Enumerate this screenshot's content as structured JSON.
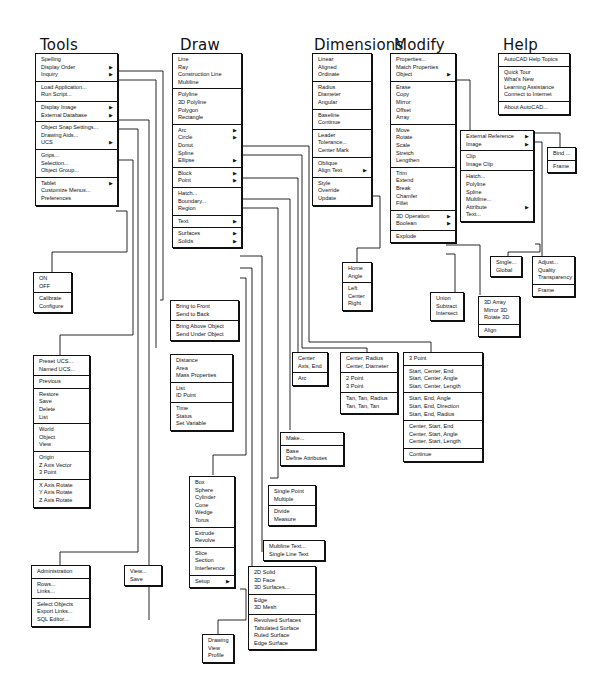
{
  "headers": {
    "tools": "Tools",
    "draw": "Draw",
    "dimensions": "Dimensions",
    "modify": "Modify",
    "help": "Help"
  },
  "menus": {
    "tools": [
      [
        {
          "label": "Spelling"
        },
        {
          "label": "Display Order",
          "sub": true
        },
        {
          "label": "Inquiry",
          "sub": true
        }
      ],
      [
        {
          "label": "Load Application..."
        },
        {
          "label": "Run Script..."
        }
      ],
      [
        {
          "label": "Display Image",
          "sub": true
        },
        {
          "label": "External Database",
          "sub": true
        }
      ],
      [
        {
          "label": "Object Snap Settings..."
        },
        {
          "label": "Drawing Aids..."
        },
        {
          "label": "UCS",
          "sub": true
        }
      ],
      [
        {
          "label": "Grips..."
        },
        {
          "label": "Selection..."
        },
        {
          "label": "Object Group..."
        }
      ],
      [
        {
          "label": "Tablet",
          "sub": true
        },
        {
          "label": "Customize Menus..."
        },
        {
          "label": "Preferences"
        }
      ]
    ],
    "tablet": [
      [
        {
          "label": "ON"
        },
        {
          "label": "OFF"
        }
      ],
      [
        {
          "label": "Calibrate"
        },
        {
          "label": "Configure"
        }
      ]
    ],
    "ucs": [
      [
        {
          "label": "Preset UCS..."
        },
        {
          "label": "Named UCS..."
        }
      ],
      [
        {
          "label": "Previous"
        }
      ],
      [
        {
          "label": "Restore"
        },
        {
          "label": "Save"
        },
        {
          "label": "Delete"
        },
        {
          "label": "List"
        }
      ],
      [
        {
          "label": "World"
        },
        {
          "label": "Object"
        },
        {
          "label": "View"
        }
      ],
      [
        {
          "label": "Origin"
        },
        {
          "label": "Z Axis Vector"
        },
        {
          "label": "3 Point"
        }
      ],
      [
        {
          "label": "X Axis Rotate"
        },
        {
          "label": "Y Axis Rotate"
        },
        {
          "label": "Z Axis Rotate"
        }
      ]
    ],
    "external_database": [
      [
        {
          "label": "Administration"
        }
      ],
      [
        {
          "label": "Rows..."
        },
        {
          "label": "Links..."
        }
      ],
      [
        {
          "label": "Select Objects"
        },
        {
          "label": "Export Links..."
        },
        {
          "label": "SQL Editor..."
        }
      ]
    ],
    "display_image": [
      [
        {
          "label": "View..."
        },
        {
          "label": "Save"
        }
      ]
    ],
    "display_order": [
      [
        {
          "label": "Bring to Front"
        },
        {
          "label": "Send to Back"
        }
      ],
      [
        {
          "label": "Bring Above Object"
        },
        {
          "label": "Send Under Object"
        }
      ]
    ],
    "inquiry": [
      [
        {
          "label": "Distance"
        },
        {
          "label": "Area"
        },
        {
          "label": "Mass Properties"
        }
      ],
      [
        {
          "label": "List"
        },
        {
          "label": "ID Point"
        }
      ],
      [
        {
          "label": "Time"
        },
        {
          "label": "Status"
        },
        {
          "label": "Set Variable"
        }
      ]
    ],
    "draw": [
      [
        {
          "label": "Line"
        },
        {
          "label": "Ray"
        },
        {
          "label": "Construction Line"
        },
        {
          "label": "Multiline"
        }
      ],
      [
        {
          "label": "Polyline"
        },
        {
          "label": "3D Polyline"
        },
        {
          "label": "Polygon"
        },
        {
          "label": "Rectangle"
        }
      ],
      [
        {
          "label": "Arc",
          "sub": true
        },
        {
          "label": "Circle",
          "sub": true
        },
        {
          "label": "Donut"
        },
        {
          "label": "Spline"
        },
        {
          "label": "Ellipse",
          "sub": true
        }
      ],
      [
        {
          "label": "Block",
          "sub": true
        },
        {
          "label": "Point",
          "sub": true
        }
      ],
      [
        {
          "label": "Hatch..."
        },
        {
          "label": "Boundary..."
        },
        {
          "label": "Region"
        }
      ],
      [
        {
          "label": "Text",
          "sub": true
        }
      ],
      [
        {
          "label": "Surfaces",
          "sub": true
        },
        {
          "label": "Solids",
          "sub": true
        }
      ]
    ],
    "solids": [
      [
        {
          "label": "Box"
        },
        {
          "label": "Sphere"
        },
        {
          "label": "Cylinder"
        },
        {
          "label": "Cone"
        },
        {
          "label": "Wedge"
        },
        {
          "label": "Torus"
        }
      ],
      [
        {
          "label": "Extrude"
        },
        {
          "label": "Revolve"
        }
      ],
      [
        {
          "label": "Slice"
        },
        {
          "label": "Section"
        },
        {
          "label": "Interference"
        }
      ],
      [
        {
          "label": "Setup",
          "sub": true
        }
      ]
    ],
    "setup": [
      [
        {
          "label": "Drawing"
        },
        {
          "label": "View"
        },
        {
          "label": "Profile"
        }
      ]
    ],
    "surfaces": [
      [
        {
          "label": "2D Solid"
        },
        {
          "label": "3D Face"
        },
        {
          "label": "3D Surfaces..."
        }
      ],
      [
        {
          "label": "Edge"
        },
        {
          "label": "3D Mesh"
        }
      ],
      [
        {
          "label": "Revolved Surfaces"
        },
        {
          "label": "Tabulated Surface"
        },
        {
          "label": "Ruled Surface"
        },
        {
          "label": "Edge Surface"
        }
      ]
    ],
    "text": [
      [
        {
          "label": "Multiline Text..."
        },
        {
          "label": "Single Line Text"
        }
      ]
    ],
    "point": [
      [
        {
          "label": "Single Point"
        },
        {
          "label": "Multiple"
        }
      ],
      [
        {
          "label": "Divide"
        },
        {
          "label": "Measure"
        }
      ]
    ],
    "block": [
      [
        {
          "label": "Make..."
        }
      ],
      [
        {
          "label": "Base"
        },
        {
          "label": "Define Attributes"
        }
      ]
    ],
    "ellipse": [
      [
        {
          "label": "Center"
        },
        {
          "label": "Axis, End"
        }
      ],
      [
        {
          "label": "Arc"
        }
      ]
    ],
    "circle": [
      [
        {
          "label": "Center, Radius"
        },
        {
          "label": "Center, Diameter"
        }
      ],
      [
        {
          "label": "2 Point"
        },
        {
          "label": "3 Point"
        }
      ],
      [
        {
          "label": "Tan, Tan, Radius"
        },
        {
          "label": "Tan, Tan, Tan"
        }
      ]
    ],
    "arc": [
      [
        {
          "label": "3 Point"
        }
      ],
      [
        {
          "label": "Start, Center, End"
        },
        {
          "label": "Start, Center, Angle"
        },
        {
          "label": "Start, Center, Length"
        }
      ],
      [
        {
          "label": "Start, End, Angle"
        },
        {
          "label": "Start, End, Direction"
        },
        {
          "label": "Start, End, Radius"
        }
      ],
      [
        {
          "label": "Center, Start, End"
        },
        {
          "label": "Center, Start, Angle"
        },
        {
          "label": "Center, Start, Length"
        }
      ],
      [
        {
          "label": "Continue"
        }
      ]
    ],
    "dimensions": [
      [
        {
          "label": "Linear"
        },
        {
          "label": "Aligned"
        },
        {
          "label": "Ordinate"
        }
      ],
      [
        {
          "label": "Radius"
        },
        {
          "label": "Diameter"
        },
        {
          "label": "Angular"
        }
      ],
      [
        {
          "label": "Baseline"
        },
        {
          "label": "Continue"
        }
      ],
      [
        {
          "label": "Leader"
        },
        {
          "label": "Tolerance..."
        },
        {
          "label": "Center Mark"
        }
      ],
      [
        {
          "label": "Oblique"
        },
        {
          "label": "Align Text",
          "sub": true
        }
      ],
      [
        {
          "label": "Style"
        },
        {
          "label": "Override"
        },
        {
          "label": "Update"
        }
      ]
    ],
    "align_text": [
      [
        {
          "label": "Home"
        },
        {
          "label": "Angle"
        }
      ],
      [
        {
          "label": "Left"
        },
        {
          "label": "Center"
        },
        {
          "label": "Right"
        }
      ]
    ],
    "modify": [
      [
        {
          "label": "Properties..."
        },
        {
          "label": "Match Properties"
        },
        {
          "label": "Object",
          "sub": true
        }
      ],
      [
        {
          "label": "Erase"
        },
        {
          "label": "Copy"
        },
        {
          "label": "Mirror"
        },
        {
          "label": "Offset"
        },
        {
          "label": "Array"
        }
      ],
      [
        {
          "label": "Move"
        },
        {
          "label": "Rotate"
        },
        {
          "label": "Scale"
        },
        {
          "label": "Stretch"
        },
        {
          "label": "Lengthen"
        }
      ],
      [
        {
          "label": "Trim"
        },
        {
          "label": "Extend"
        },
        {
          "label": "Break"
        },
        {
          "label": "Chamfer"
        },
        {
          "label": "Fillet"
        }
      ],
      [
        {
          "label": "3D Operation",
          "sub": true
        },
        {
          "label": "Boolean",
          "sub": true
        }
      ],
      [
        {
          "label": "Explode"
        }
      ]
    ],
    "boolean": [
      [
        {
          "label": "Union"
        },
        {
          "label": "Subtract"
        },
        {
          "label": "Intersect"
        }
      ]
    ],
    "operation_3d": [
      [
        {
          "label": "3D Array"
        },
        {
          "label": "Mirror 3D"
        },
        {
          "label": "Rotate 3D"
        }
      ],
      [
        {
          "label": "Align"
        }
      ]
    ],
    "object": [
      [
        {
          "label": "External Reference",
          "sub": true
        },
        {
          "label": "Image",
          "sub": true
        }
      ],
      [
        {
          "label": "Clip"
        },
        {
          "label": "Image Clip"
        }
      ],
      [
        {
          "label": "Hatch..."
        },
        {
          "label": "Polyline"
        },
        {
          "label": "Spline"
        },
        {
          "label": "Multiline..."
        },
        {
          "label": "Attribute",
          "sub": true
        },
        {
          "label": "Text..."
        }
      ]
    ],
    "external_reference": [
      [
        {
          "label": "Bind ..."
        }
      ],
      [
        {
          "label": "Frame"
        }
      ]
    ],
    "image": [
      [
        {
          "label": "Adjust..."
        },
        {
          "label": "Quality"
        },
        {
          "label": "Transparency"
        }
      ],
      [
        {
          "label": "Frame"
        }
      ]
    ],
    "attribute": [
      [
        {
          "label": "Single..."
        },
        {
          "label": "Global"
        }
      ]
    ],
    "help": [
      [
        {
          "label": "AutoCAD Help Topics"
        }
      ],
      [
        {
          "label": "Quick Tour"
        },
        {
          "label": "What's New"
        },
        {
          "label": "Learning Assistance"
        },
        {
          "label": "Connect to Internet"
        }
      ],
      [
        {
          "label": "About AutoCAD..."
        }
      ]
    ]
  },
  "submenu_arrow": "▶",
  "colors": {
    "ink": "#111111",
    "paper": "#ffffff"
  }
}
